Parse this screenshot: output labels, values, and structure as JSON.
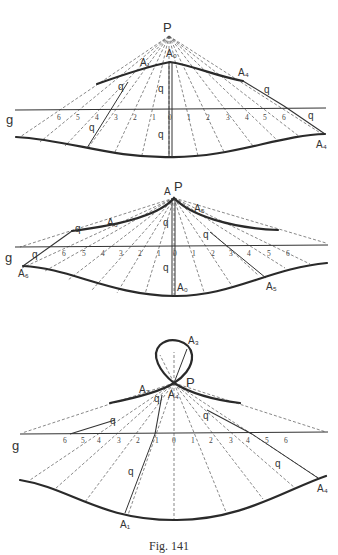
{
  "figure": {
    "caption": "Fig. 141",
    "colors": {
      "ink": "#2a2a2a",
      "paper": "#ffffff"
    }
  },
  "panels": [
    {
      "id": "top",
      "pole_label": "P",
      "line_label": "g",
      "curve_labels": {
        "upper_left": "A₁",
        "upper_top": "A₀",
        "upper_right": "A₄",
        "lower_right": "A₄"
      },
      "segment_labels": [
        "q",
        "q",
        "q",
        "q",
        "q",
        "q"
      ],
      "scale_left": [
        "6",
        "5",
        "4",
        "3",
        "2",
        "1"
      ],
      "scale_center": "0",
      "scale_right": [
        "1",
        "2",
        "3",
        "4",
        "5",
        "6"
      ]
    },
    {
      "id": "middle",
      "pole_label": "P",
      "apex_label": "A",
      "line_label": "g",
      "curve_labels": {
        "upper_left": "A₆",
        "upper_right": "A₅",
        "lower_left": "A₆",
        "lower_center": "A₀",
        "lower_right": "A₅"
      },
      "segment_labels": [
        "q",
        "q",
        "q",
        "q",
        "q"
      ],
      "scale_left": [
        "6",
        "5",
        "4",
        "3",
        "2",
        "1"
      ],
      "scale_center": "0",
      "scale_right": [
        "1",
        "2",
        "3",
        "4",
        "5",
        "6"
      ]
    },
    {
      "id": "bottom",
      "pole_label": "P",
      "line_label": "g",
      "curve_labels": {
        "loop_top": "A₃",
        "upper_left": "A₂",
        "upper_center": "A₄",
        "lower_left": "A₁",
        "lower_right": "A₄"
      },
      "segment_labels": [
        "q",
        "q",
        "q",
        "q",
        "q"
      ],
      "scale_left": [
        "6",
        "5",
        "4",
        "3",
        "2",
        "1"
      ],
      "scale_center": "0",
      "scale_right": [
        "1",
        "2",
        "3",
        "4",
        "5",
        "6"
      ]
    }
  ]
}
